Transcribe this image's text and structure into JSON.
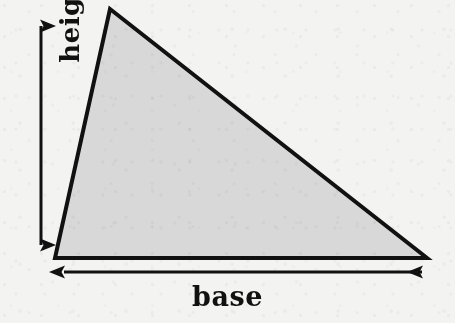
{
  "figure": {
    "kind": "geometry-diagram",
    "background_color": "#f3f3f1",
    "ink_color": "#111111"
  },
  "shape": {
    "name": "triangle",
    "fill_color": "#d8d8d8",
    "stroke_color": "#111111",
    "stroke_width": 4,
    "vertices": [
      {
        "name": "apex",
        "x": 110,
        "y": 9
      },
      {
        "name": "bottom-right",
        "x": 427,
        "y": 258
      },
      {
        "name": "bottom-left",
        "x": 55,
        "y": 258
      }
    ]
  },
  "dimensions": {
    "height": {
      "label": "height",
      "orientation": "vertical",
      "rotation_deg": -90,
      "arrow_style": "double-headed",
      "x": 41,
      "y_start": 12,
      "y_end": 259,
      "label_center": {
        "x": 21,
        "y": 136
      }
    },
    "base": {
      "label": "base",
      "orientation": "horizontal",
      "rotation_deg": 0,
      "arrow_style": "double-headed",
      "y": 272,
      "x_start": 49,
      "x_end": 437,
      "label_center": {
        "x": 235,
        "y": 297
      }
    }
  },
  "labels": {
    "base_text": "base",
    "height_text": "height"
  }
}
